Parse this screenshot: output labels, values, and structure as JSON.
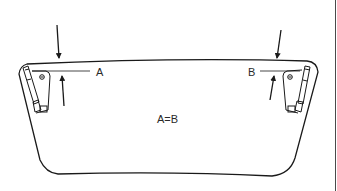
{
  "diagram": {
    "labels": {
      "left_measure": "A",
      "right_measure": "B",
      "equation": "A=B"
    },
    "colors": {
      "line": "#1a1a1a",
      "background": "#ffffff"
    }
  }
}
